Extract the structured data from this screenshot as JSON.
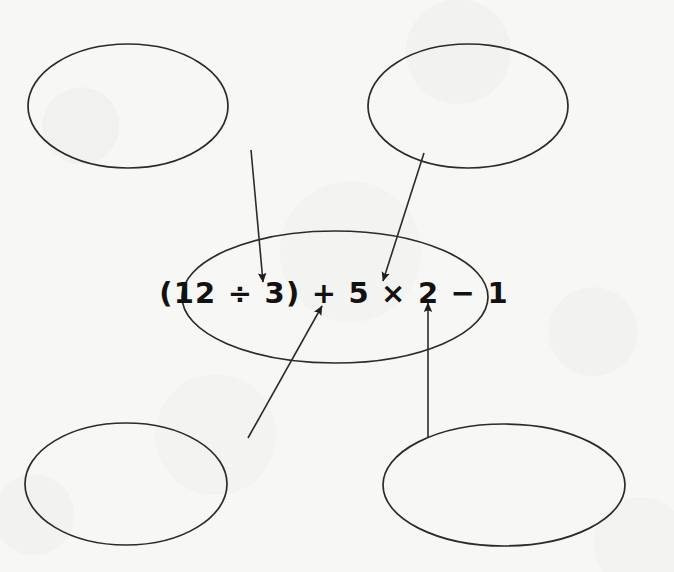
{
  "diagram": {
    "type": "labelling-diagram",
    "stroke_color": "#2b2b2b",
    "text_color": "#121212",
    "background_color": "#f7f7f6",
    "center_node": {
      "name": "expression-ellipse",
      "expression": "(12 ÷ 3) + 5 × 2 − 1",
      "cx": 335,
      "cy": 297,
      "rx": 153,
      "ry": 66
    },
    "blank_nodes": [
      {
        "name": "blank-ellipse-top-left",
        "label": "",
        "cx": 128,
        "cy": 106,
        "rx": 100,
        "ry": 62
      },
      {
        "name": "blank-ellipse-top-right",
        "label": "",
        "cx": 468,
        "cy": 106,
        "rx": 100,
        "ry": 62
      },
      {
        "name": "blank-ellipse-bottom-left",
        "label": "",
        "cx": 126,
        "cy": 484,
        "rx": 101,
        "ry": 61
      },
      {
        "name": "blank-ellipse-bottom-right",
        "label": "",
        "cx": 504,
        "cy": 485,
        "rx": 121,
        "ry": 61
      }
    ],
    "connectors": [
      {
        "name": "arrow-top-left-to-division",
        "from": "blank-ellipse-top-left",
        "to_symbol": "÷",
        "x1": 251,
        "y1": 150,
        "x2": 263,
        "y2": 282,
        "direction": "down"
      },
      {
        "name": "arrow-top-right-to-multiplication",
        "from": "blank-ellipse-top-right",
        "to_symbol": "×",
        "x1": 424,
        "y1": 153,
        "x2": 383,
        "y2": 281,
        "direction": "down-left"
      },
      {
        "name": "arrow-bottom-left-to-addition",
        "from": "blank-ellipse-bottom-left",
        "to_symbol": "+",
        "x1": 248,
        "y1": 438,
        "x2": 322,
        "y2": 306,
        "direction": "up-right"
      },
      {
        "name": "arrow-bottom-right-to-subtraction",
        "from": "blank-ellipse-bottom-right",
        "to_symbol": "−",
        "x1": 428,
        "y1": 437,
        "x2": 428,
        "y2": 303,
        "direction": "up"
      }
    ]
  }
}
